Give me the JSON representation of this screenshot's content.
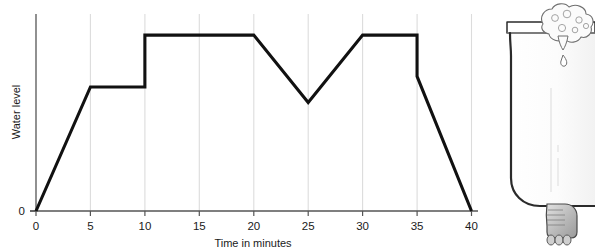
{
  "figure": {
    "background_color": "#ffffff",
    "line_color": "#111111",
    "gridline_color": "#d8d8d8",
    "axis_color": "#555555"
  },
  "chart_data": {
    "type": "line",
    "title": "",
    "xlabel": "Time in minutes",
    "ylabel": "Water level",
    "xlim": [
      0,
      40
    ],
    "ylim": [
      0,
      1.12
    ],
    "grid": true,
    "legend": null,
    "x_ticks": [
      0,
      5,
      10,
      15,
      20,
      25,
      30,
      35,
      40
    ],
    "x_tick_labels": [
      "0",
      "5",
      "10",
      "15",
      "20",
      "25",
      "30",
      "35",
      "40"
    ],
    "y_ticks": [
      0
    ],
    "y_tick_labels": [
      "0"
    ],
    "y_axis_unlabeled_note": "Water level axis has no numeric scale except 0 at origin",
    "series": [
      {
        "name": "Water level",
        "x": [
          0,
          5,
          10,
          10,
          20,
          25,
          30,
          35,
          35,
          40
        ],
        "y": [
          0,
          0.705,
          0.705,
          1.0,
          1.0,
          0.617,
          1.0,
          1.0,
          0.765,
          0
        ],
        "segments": [
          {
            "from_minute": 0,
            "to_minute": 5,
            "description": "rises steadily from empty"
          },
          {
            "from_minute": 5,
            "to_minute": 10,
            "description": "holds constant at first level"
          },
          {
            "from_minute": 10,
            "to_minute": 10,
            "description": "instantaneous jump up to full level"
          },
          {
            "from_minute": 10,
            "to_minute": 20,
            "description": "holds constant at full level"
          },
          {
            "from_minute": 20,
            "to_minute": 25,
            "description": "falls steadily"
          },
          {
            "from_minute": 25,
            "to_minute": 30,
            "description": "rises steadily back to full level"
          },
          {
            "from_minute": 30,
            "to_minute": 35,
            "description": "holds constant at full level"
          },
          {
            "from_minute": 35,
            "to_minute": 35,
            "description": "instantaneous drop"
          },
          {
            "from_minute": 35,
            "to_minute": 40,
            "description": "drains steadily to empty"
          }
        ]
      }
    ]
  },
  "illustration": {
    "name": "bathtub",
    "description": "Clawfoot bathtub seen from the side, cut off at the right edge of the image, with a cloud of soap suds on the near rim and a single drop falling from it",
    "parts": [
      {
        "name": "tub-body",
        "label": "bathtub"
      },
      {
        "name": "tub-rim",
        "label": "rim"
      },
      {
        "name": "soap-suds",
        "label": "soap suds"
      },
      {
        "name": "water-drop",
        "label": "drip"
      },
      {
        "name": "claw-foot",
        "label": "claw foot"
      }
    ],
    "colors": {
      "outline": "#2b2b2b",
      "body_fill": "#fdfdfd",
      "foot_fill": "#b9b9b9",
      "suds_fill": "#fbfbfb",
      "shading": "#eeeeee"
    }
  }
}
